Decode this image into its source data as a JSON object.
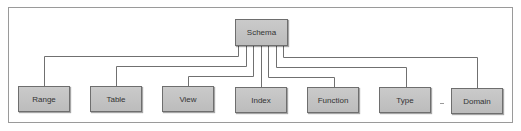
{
  "diagram": {
    "type": "hierarchy",
    "colors": {
      "node_fill": "#c4c4c4",
      "node_border": "#6e6e6e",
      "connector": "#707070",
      "frame_border": "#9a9a9a",
      "text": "#333333"
    },
    "root": {
      "label": "Schema"
    },
    "children": [
      {
        "label": "Range"
      },
      {
        "label": "Table"
      },
      {
        "label": "View"
      },
      {
        "label": "Index"
      },
      {
        "label": "Function"
      },
      {
        "label": "Type"
      },
      {
        "label": "Domain"
      }
    ],
    "ellipsis_between": [
      "Type",
      "Domain"
    ]
  }
}
